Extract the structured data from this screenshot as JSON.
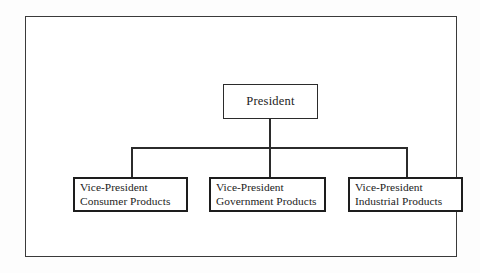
{
  "diagram": {
    "type": "organization-chart",
    "title": "",
    "orientation": "top-down",
    "frame_color": "#3a3a3a",
    "line_color": "#2b2b2b",
    "box_border_color": "#1d1d1d",
    "background_color": "#ffffff"
  },
  "nodes": {
    "root": {
      "id": "president",
      "line1": "President",
      "line2": "",
      "level": 0
    },
    "children": [
      {
        "id": "vp-consumer",
        "line1": "Vice-President",
        "line2": "Consumer Products",
        "level": 1
      },
      {
        "id": "vp-government",
        "line1": "Vice-President",
        "line2": "Government Products",
        "level": 1
      },
      {
        "id": "vp-industrial",
        "line1": "Vice-President",
        "line2": "Industrial Products",
        "level": 1
      }
    ]
  }
}
